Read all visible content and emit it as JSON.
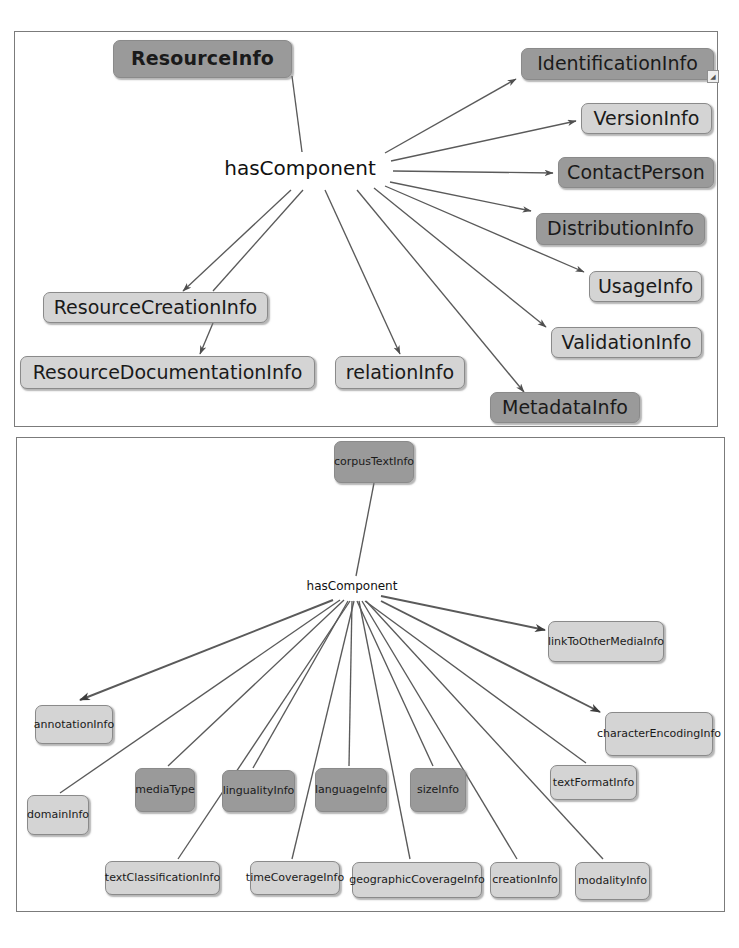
{
  "figure": {
    "type": "diagram",
    "subtype": "ontology-class-hierarchy",
    "panels": [
      {
        "id": "panel-top",
        "root": "ResourceInfo",
        "relation": "hasComponent",
        "nodes": [
          {
            "label": "ResourceInfo",
            "shade": "dark",
            "role": "root"
          },
          {
            "label": "IdentificationInfo",
            "shade": "dark",
            "role": "component"
          },
          {
            "label": "VersionInfo",
            "shade": "light",
            "role": "component"
          },
          {
            "label": "ContactPerson",
            "shade": "dark",
            "role": "component"
          },
          {
            "label": "DistributionInfo",
            "shade": "dark",
            "role": "component"
          },
          {
            "label": "UsageInfo",
            "shade": "light",
            "role": "component"
          },
          {
            "label": "ValidationInfo",
            "shade": "light",
            "role": "component"
          },
          {
            "label": "MetadataInfo",
            "shade": "dark",
            "role": "component"
          },
          {
            "label": "ResourceCreationInfo",
            "shade": "light",
            "role": "component"
          },
          {
            "label": "ResourceDocumentationInfo",
            "shade": "light",
            "role": "component"
          },
          {
            "label": "relationInfo",
            "shade": "light",
            "role": "component"
          }
        ]
      },
      {
        "id": "panel-bottom",
        "root": "corpusTextInfo",
        "relation": "hasComponent",
        "nodes": [
          {
            "label": "corpusTextInfo",
            "shade": "dark",
            "role": "root"
          },
          {
            "label": "linkToOtherMediaInfo",
            "shade": "light",
            "role": "component"
          },
          {
            "label": "characterEncodingInfo",
            "shade": "light",
            "role": "component"
          },
          {
            "label": "annotationInfo",
            "shade": "light",
            "role": "component"
          },
          {
            "label": "domainInfo",
            "shade": "light",
            "role": "component"
          },
          {
            "label": "mediaType",
            "shade": "dark",
            "role": "component"
          },
          {
            "label": "lingualityInfo",
            "shade": "dark",
            "role": "component"
          },
          {
            "label": "languageInfo",
            "shade": "dark",
            "role": "component"
          },
          {
            "label": "sizeInfo",
            "shade": "dark",
            "role": "component"
          },
          {
            "label": "textFormatInfo",
            "shade": "light",
            "role": "component"
          },
          {
            "label": "textClassificationInfo",
            "shade": "light",
            "role": "component"
          },
          {
            "label": "timeCoverageInfo",
            "shade": "light",
            "role": "component"
          },
          {
            "label": "geographicCoverageInfo",
            "shade": "light",
            "role": "component"
          },
          {
            "label": "creationInfo",
            "shade": "light",
            "role": "component"
          },
          {
            "label": "modalityInfo",
            "shade": "light",
            "role": "component"
          }
        ]
      }
    ],
    "colors": {
      "dark_fill": "#9a9a9a",
      "light_fill": "#d4d4d4",
      "border": "#8a8a8a",
      "edge": "#5a5a5a",
      "panel_border": "#7b7b7b",
      "background": "#ffffff"
    },
    "corner_mark": "◢"
  }
}
